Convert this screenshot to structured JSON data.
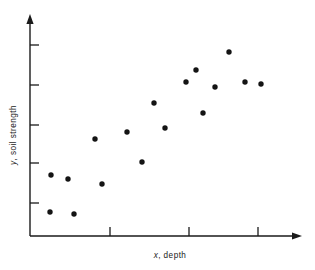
{
  "figure": {
    "background_color": "#ffffff",
    "ink_color": "#1a1a1a",
    "point_color": "#141414"
  },
  "axes": {
    "x_label_full": "x , depth",
    "x_label_variable": "x",
    "x_label_text": ", depth",
    "y_label_full": "y, soil strength",
    "y_label_variable": "y",
    "y_label_text": ", soil strength",
    "x_tick_count": 3,
    "y_tick_count": 5,
    "has_arrowheads": true,
    "tick_labels_shown": false
  },
  "chart_data": {
    "type": "scatter",
    "title": "",
    "xlabel": "x , depth",
    "ylabel": "y, soil strength",
    "xlim": [
      0,
      100
    ],
    "ylim": [
      0,
      100
    ],
    "grid": false,
    "legend": null,
    "n_points": 17,
    "x": [
      4.7,
      11.2,
      4.3,
      13.5,
      21.8,
      24.5,
      36.6,
      42.9,
      47.6,
      52.0,
      60.7,
      64.7,
      67.3,
      72.2,
      77.8,
      84.2,
      90.6
    ],
    "y": [
      26.9,
      24.7,
      6.7,
      5.1,
      45.2,
      20.7,
      51.4,
      35.0,
      67.7,
      54.9,
      79.8,
      86.0,
      68.8,
      72.6,
      92.5,
      73.1,
      72.6
    ],
    "points": [
      {
        "px": 51,
        "py": 175,
        "x": 4.7,
        "y": 26.9
      },
      {
        "px": 68,
        "py": 179,
        "x": 11.2,
        "y": 24.7
      },
      {
        "px": 50,
        "py": 212,
        "x": 4.3,
        "y": 6.7
      },
      {
        "px": 74,
        "py": 214,
        "x": 13.5,
        "y": 5.1
      },
      {
        "px": 95,
        "py": 139,
        "x": 21.8,
        "y": 45.2
      },
      {
        "px": 102,
        "py": 184,
        "x": 24.5,
        "y": 20.7
      },
      {
        "px": 127,
        "py": 132,
        "x": 36.6,
        "y": 51.4
      },
      {
        "px": 142,
        "py": 162,
        "x": 42.9,
        "y": 35.0
      },
      {
        "px": 154,
        "py": 103,
        "x": 47.6,
        "y": 67.7
      },
      {
        "px": 165,
        "py": 128,
        "x": 52.0,
        "y": 54.9
      },
      {
        "px": 186,
        "py": 82,
        "x": 60.7,
        "y": 79.8
      },
      {
        "px": 196,
        "py": 70,
        "x": 64.7,
        "y": 86.0
      },
      {
        "px": 203,
        "py": 113,
        "x": 67.3,
        "y": 68.8
      },
      {
        "px": 215,
        "py": 87,
        "x": 72.2,
        "y": 72.6
      },
      {
        "px": 229,
        "py": 52,
        "x": 77.8,
        "y": 92.5
      },
      {
        "px": 245,
        "py": 82,
        "x": 84.2,
        "y": 73.1
      },
      {
        "px": 261,
        "py": 84,
        "x": 90.6,
        "y": 72.6
      }
    ]
  },
  "geometry": {
    "y_axis_x": 30,
    "y_axis_top": 18,
    "x_axis_y": 236,
    "x_axis_right": 300,
    "y_ticks_py": [
      45,
      85,
      125,
      163,
      203
    ],
    "x_ticks_px": [
      110,
      189,
      258
    ]
  }
}
